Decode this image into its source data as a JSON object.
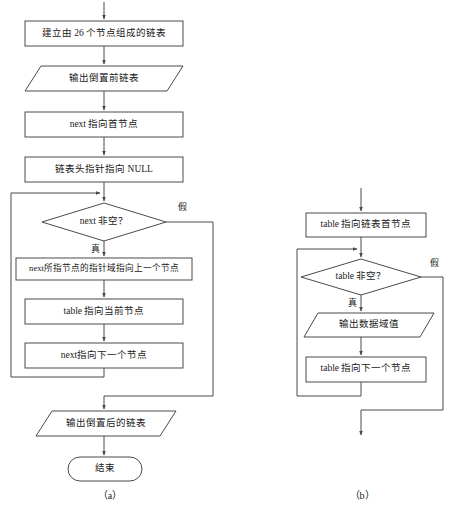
{
  "diagram": {
    "type": "flowchart",
    "panels": [
      {
        "id": "panel-a",
        "caption": "（a）",
        "nodes": [
          {
            "id": "a-create-list",
            "shape": "process",
            "text": "建立由 26 个节点组成的链表"
          },
          {
            "id": "a-print-before",
            "shape": "input-output",
            "text": "输出倒置前链表"
          },
          {
            "id": "a-next-head",
            "shape": "process",
            "text": "next 指向首节点"
          },
          {
            "id": "a-head-null",
            "shape": "process",
            "text": "链表头指针指向 NULL"
          },
          {
            "id": "a-next-notnull",
            "shape": "decision",
            "text": "next 非空？"
          },
          {
            "id": "a-reverse-link",
            "shape": "process",
            "text": "next所指节点的指针域指向上一个节点"
          },
          {
            "id": "a-table-current",
            "shape": "process",
            "text": "table 指向当前节点"
          },
          {
            "id": "a-next-advance",
            "shape": "process",
            "text": "next指向下一个节点"
          },
          {
            "id": "a-print-after",
            "shape": "input-output",
            "text": "输出倒置后的链表"
          },
          {
            "id": "a-end",
            "shape": "terminator",
            "text": "结束"
          }
        ],
        "branch_labels": {
          "true": "真",
          "false": "假"
        }
      },
      {
        "id": "panel-b",
        "caption": "（b）",
        "nodes": [
          {
            "id": "b-table-head",
            "shape": "process",
            "text": "table 指向链表首节点"
          },
          {
            "id": "b-table-notnull",
            "shape": "decision",
            "text": "table 非空？"
          },
          {
            "id": "b-print-data",
            "shape": "input-output",
            "text": "输出数据域值"
          },
          {
            "id": "b-table-advance",
            "shape": "process",
            "text": "table 指向下一个节点"
          }
        ],
        "branch_labels": {
          "true": "真",
          "false": "假"
        }
      }
    ]
  },
  "colors": {
    "stroke": "#4a4a4a",
    "fill": "#ffffff",
    "text": "#1a1a1a",
    "background": "#ffffff"
  }
}
